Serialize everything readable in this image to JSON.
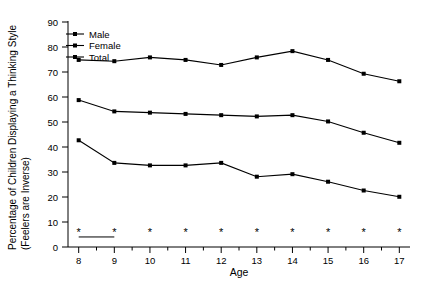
{
  "chart_data": {
    "type": "line",
    "title": "",
    "xlabel": "Age",
    "ylabel": "Percentage of Children Displaying a Thinking Style (Feelers are Inverse)",
    "ylabel_line1": "Percentage of Children Displaying a  Thinking Style",
    "ylabel_line2": "(Feelers are Inverse)",
    "categories": [
      8,
      9,
      10,
      11,
      12,
      13,
      14,
      15,
      16,
      17
    ],
    "x": [
      8,
      9,
      10,
      11,
      12,
      13,
      14,
      15,
      16,
      17
    ],
    "xlim": [
      7.7,
      17.3
    ],
    "ylim": [
      0,
      90
    ],
    "yticks": [
      0,
      10,
      20,
      30,
      40,
      50,
      60,
      70,
      80,
      90
    ],
    "xticks": [
      8,
      9,
      10,
      11,
      12,
      13,
      14,
      15,
      16,
      17
    ],
    "xtick_labels": [
      "8",
      "9",
      "10",
      "11",
      "12",
      "13",
      "14",
      "15",
      "16",
      "17"
    ],
    "ytick_labels": [
      "0",
      "10",
      "20",
      "30",
      "40",
      "50",
      "60",
      "70",
      "80",
      "90"
    ],
    "grid": false,
    "legend_position": "upper-left-inside",
    "series": [
      {
        "name": "Male",
        "marker": "filled-square",
        "color": "#000000",
        "values": [
          42.5,
          33.5,
          32.5,
          32.5,
          33.5,
          28.0,
          29.0,
          26.0,
          22.5,
          20.0
        ]
      },
      {
        "name": "Female",
        "marker": "filled-square",
        "color": "#000000",
        "values": [
          58.5,
          54.0,
          53.5,
          53.0,
          52.5,
          52.0,
          52.5,
          50.0,
          45.5,
          41.5
        ]
      },
      {
        "name": "Total",
        "marker": "filled-square",
        "color": "#000000",
        "values": [
          74.5,
          74.0,
          75.5,
          74.5,
          72.5,
          75.5,
          78.0,
          74.5,
          69.0,
          66.0
        ]
      }
    ],
    "annotations": {
      "significance_marker": "*",
      "significance_marker_y": 6,
      "significance_marker_ages": [
        8,
        9,
        10,
        11,
        12,
        13,
        14,
        15,
        16,
        17
      ],
      "bracket_line": {
        "from_age": 8,
        "to_age": 9,
        "y": 4
      }
    }
  },
  "legend": {
    "items": [
      {
        "label": "Male"
      },
      {
        "label": "Female"
      },
      {
        "label": "Total"
      }
    ]
  },
  "axes": {
    "x_title": "Age",
    "y_title_line1": "Percentage of Children Displaying a  Thinking Style",
    "y_title_line2": "(Feelers are Inverse)"
  }
}
